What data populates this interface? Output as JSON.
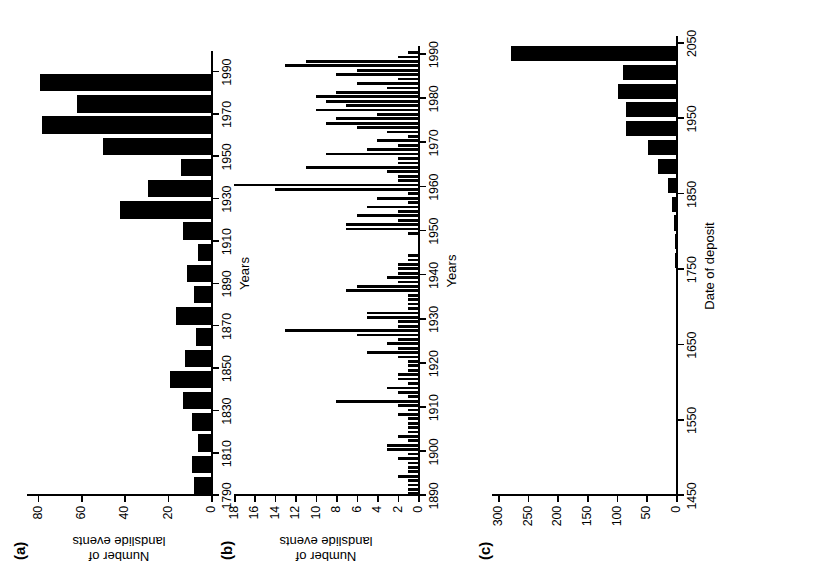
{
  "figure": {
    "panels": [
      {
        "id": "a",
        "label": "(a)",
        "xlabel": "Years",
        "ylabel_lines": [
          "Number of",
          "landslide events"
        ],
        "chart": {
          "type": "bar",
          "title": "",
          "xlabel": "Years",
          "ylabel": "Number of landslide events",
          "xlim": [
            1790,
            2000
          ],
          "ylim": [
            0,
            85
          ],
          "xticks": [
            1790,
            1810,
            1830,
            1850,
            1870,
            1890,
            1910,
            1930,
            1950,
            1970,
            1990
          ],
          "yticks": [
            0,
            20,
            40,
            60,
            80
          ],
          "grid": false,
          "bin_width": 10,
          "categories": [
            1790,
            1800,
            1810,
            1820,
            1830,
            1840,
            1850,
            1860,
            1870,
            1880,
            1890,
            1900,
            1910,
            1920,
            1930,
            1940,
            1950,
            1960,
            1970,
            1980,
            1990
          ],
          "values": [
            8,
            9,
            6,
            9,
            13,
            19,
            12,
            7,
            16,
            8,
            11,
            6,
            13,
            42,
            29,
            14,
            50,
            78,
            62,
            79,
            0
          ]
        }
      },
      {
        "id": "b",
        "label": "(b)",
        "xlabel": "Years",
        "ylabel_lines": [
          "Number of",
          "landslide events"
        ],
        "chart": {
          "type": "bar",
          "title": "",
          "xlabel": "Years",
          "ylabel": "Number of landslide events",
          "xlim": [
            1890,
            1992
          ],
          "ylim": [
            0,
            18
          ],
          "xticks": [
            1890,
            1900,
            1910,
            1920,
            1930,
            1940,
            1950,
            1960,
            1970,
            1980,
            1990
          ],
          "yticks": [
            0,
            2,
            4,
            6,
            8,
            10,
            12,
            14,
            16,
            18
          ],
          "grid": false,
          "bin_width": 1,
          "categories": [
            1890,
            1891,
            1892,
            1893,
            1894,
            1895,
            1896,
            1897,
            1898,
            1899,
            1900,
            1901,
            1902,
            1903,
            1904,
            1905,
            1906,
            1907,
            1908,
            1909,
            1910,
            1911,
            1912,
            1913,
            1914,
            1915,
            1916,
            1917,
            1918,
            1919,
            1920,
            1921,
            1922,
            1923,
            1924,
            1925,
            1926,
            1927,
            1928,
            1929,
            1930,
            1931,
            1932,
            1933,
            1934,
            1935,
            1936,
            1937,
            1938,
            1939,
            1940,
            1941,
            1942,
            1943,
            1944,
            1945,
            1946,
            1947,
            1948,
            1949,
            1950,
            1951,
            1952,
            1953,
            1954,
            1955,
            1956,
            1957,
            1958,
            1959,
            1960,
            1961,
            1962,
            1963,
            1964,
            1965,
            1966,
            1967,
            1968,
            1969,
            1970,
            1971,
            1972,
            1973,
            1974,
            1975,
            1976,
            1977,
            1978,
            1979,
            1980,
            1981,
            1982,
            1983,
            1984,
            1985,
            1986,
            1987,
            1988,
            1989,
            1990
          ],
          "values": [
            1,
            1,
            1,
            1,
            2,
            1,
            1,
            1,
            2,
            1,
            3,
            3,
            1,
            2,
            1,
            1,
            1,
            1,
            2,
            1,
            2,
            8,
            1,
            2,
            3,
            1,
            2,
            2,
            1,
            1,
            1,
            2,
            5,
            2,
            3,
            2,
            6,
            13,
            2,
            2,
            5,
            5,
            1,
            1,
            1,
            1,
            7,
            6,
            2,
            3,
            2,
            2,
            2,
            1,
            1,
            0,
            0,
            0,
            0,
            1,
            7,
            7,
            2,
            6,
            2,
            5,
            1,
            4,
            1,
            14,
            18,
            2,
            2,
            3,
            11,
            2,
            2,
            9,
            5,
            2,
            4,
            1,
            3,
            6,
            9,
            8,
            4,
            10,
            7,
            9,
            10,
            8,
            3,
            6,
            2,
            8,
            6,
            13,
            11,
            2,
            1
          ]
        }
      },
      {
        "id": "c",
        "label": "(c)",
        "xlabel": "Date of deposit",
        "ylabel_lines": [],
        "chart": {
          "type": "bar",
          "title": "",
          "xlabel": "Date of deposit",
          "ylabel": "",
          "xlim": [
            1450,
            2060
          ],
          "ylim": [
            0,
            310
          ],
          "xticks": [
            1450,
            1550,
            1650,
            1750,
            1850,
            1950,
            2050
          ],
          "yticks": [
            0,
            50,
            100,
            150,
            200,
            250,
            300
          ],
          "grid": false,
          "bin_width": 25,
          "categories": [
            1750,
            1775,
            1800,
            1825,
            1850,
            1875,
            1900,
            1925,
            1950,
            1975,
            2000
          ],
          "values": [
            1,
            2,
            4,
            7,
            13,
            30,
            48,
            85,
            85,
            97,
            90
          ],
          "extra_bar": {
            "x": 2025,
            "value": 278
          }
        }
      }
    ]
  }
}
